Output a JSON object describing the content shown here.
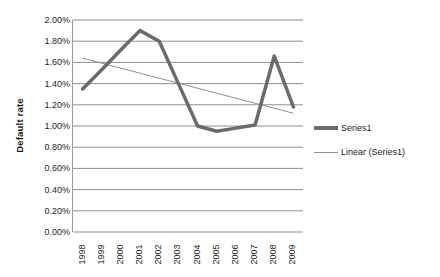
{
  "chart_data": {
    "type": "line",
    "title": "",
    "xlabel": "",
    "ylabel": "Default rate",
    "categories": [
      "1998",
      "1999",
      "2000",
      "2001",
      "2002",
      "2003",
      "2004",
      "2005",
      "2006",
      "2007",
      "2008",
      "2009"
    ],
    "ylim": [
      0,
      2.0
    ],
    "y_tick_step": 0.2,
    "y_tick_labels": [
      "2.00%",
      "1.80%",
      "1.60%",
      "1.40%",
      "1.20%",
      "1.00%",
      "0.80%",
      "0.60%",
      "0.40%",
      "0.20%",
      "0.00%"
    ],
    "y_tick_values": [
      2.0,
      1.8,
      1.6,
      1.4,
      1.2,
      1.0,
      0.8,
      0.6,
      0.4,
      0.2,
      0.0
    ],
    "y_unit": "%",
    "grid": true,
    "grid_axis": "y",
    "legend_position": "right",
    "series": [
      {
        "name": "Series1",
        "type": "line",
        "color": "#6b6b6b",
        "width": 3.5,
        "values": [
          1.35,
          1.53,
          1.72,
          1.9,
          1.8,
          1.4,
          1.0,
          0.95,
          0.98,
          1.01,
          1.66,
          1.18
        ]
      },
      {
        "name": "Linear (Series1)",
        "type": "trendline",
        "color": "#8f8f8f",
        "width": 1,
        "endpoints": [
          1.64,
          1.12
        ]
      }
    ]
  },
  "legend": {
    "items": [
      {
        "label": "Series1",
        "swatch": "thick-line-swatch"
      },
      {
        "label": "Linear (Series1)",
        "swatch": "thin-line-swatch"
      }
    ]
  },
  "axes": {
    "y_title": "Default rate"
  }
}
